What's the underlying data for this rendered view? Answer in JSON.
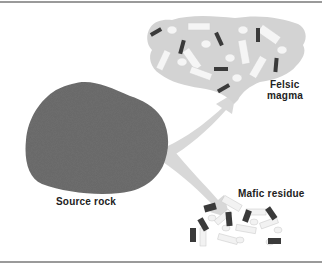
{
  "diagram": {
    "labels": {
      "source_rock": "Source rock",
      "felsic_line1": "Felsic",
      "felsic_line2": "magma",
      "mafic_residue": "Mafic residue"
    },
    "colors": {
      "source_rock": "#707070",
      "felsic_cloud": "#d4d4d4",
      "arrow": "#d8d8d8",
      "dark_crystal": "#3a3a3a",
      "light_crystal": "#f4f4f4",
      "rule": "#9a9a9a"
    }
  }
}
